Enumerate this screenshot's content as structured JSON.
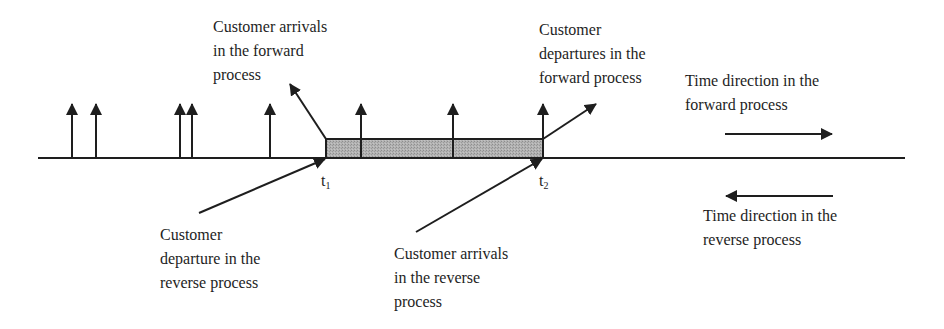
{
  "diagram": {
    "type": "timeline",
    "colors": {
      "line": "#1e1e1e",
      "busy_period_fill": "#a9a9a9",
      "background": "#ffffff"
    },
    "timeline": {
      "x_start": 38,
      "x_end": 905,
      "y": 158
    },
    "busy_period": {
      "x_start": 326,
      "x_end": 543,
      "y_top": 139,
      "y_bottom": 158,
      "label": "shaded interval between t1 and t2"
    },
    "arrival_markers_x": [
      72,
      96,
      180,
      192,
      270,
      361,
      453,
      543
    ],
    "marker_top_y": 103,
    "time_marks": [
      {
        "base": "t",
        "sub": "1",
        "x": 326
      },
      {
        "base": "t",
        "sub": "2",
        "x": 543
      }
    ],
    "annotations": [
      {
        "id": "forward-arrivals",
        "lines": [
          "Customer arrivals",
          "in the forward",
          "process"
        ],
        "pointer": {
          "from": [
            326,
            139
          ],
          "to": [
            289,
            83
          ]
        }
      },
      {
        "id": "forward-departures",
        "lines": [
          "Customer",
          "departures in the",
          "forward process"
        ],
        "pointer": {
          "from": [
            543,
            139
          ],
          "to": [
            597,
            103
          ]
        }
      },
      {
        "id": "forward-time-direction",
        "lines": [
          "Time direction in the",
          "forward process"
        ],
        "arrow": {
          "from": [
            725,
            134
          ],
          "to": [
            833,
            134
          ],
          "direction": "right"
        }
      },
      {
        "id": "reverse-departure",
        "lines": [
          "Customer",
          "departure in the",
          "reverse process"
        ],
        "pointer": {
          "from": [
            199,
            213
          ],
          "to": [
            326,
            158
          ]
        }
      },
      {
        "id": "reverse-arrivals",
        "lines": [
          "Customer arrivals",
          "in the reverse",
          "process"
        ],
        "pointer": {
          "from": [
            416,
            232
          ],
          "to": [
            543,
            158
          ]
        }
      },
      {
        "id": "reverse-time-direction",
        "lines": [
          "Time direction in the",
          "reverse process"
        ],
        "arrow": {
          "from": [
            833,
            196
          ],
          "to": [
            725,
            196
          ],
          "direction": "left"
        }
      }
    ]
  }
}
